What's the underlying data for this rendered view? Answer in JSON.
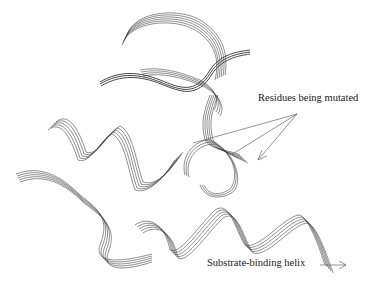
{
  "figure": {
    "type": "protein ribbon diagram",
    "annotations": [
      {
        "id": "mutated",
        "text": "Residues being mutated",
        "x": 258,
        "y": 92
      },
      {
        "id": "helix",
        "text": "Substrate-binding helix",
        "x": 207,
        "y": 257
      }
    ],
    "colors": {
      "ribbon": "#333333",
      "arrow": "#666666",
      "background": "#ffffff"
    }
  }
}
